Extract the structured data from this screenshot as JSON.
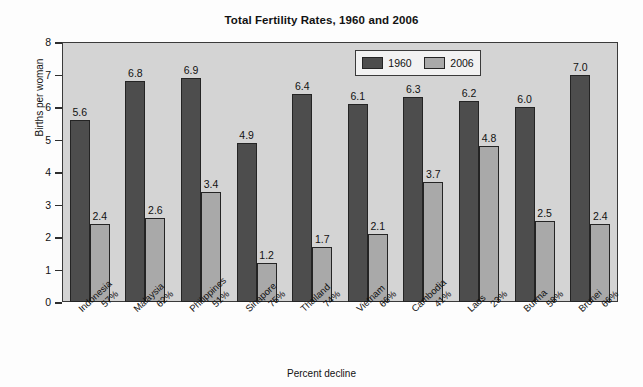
{
  "chart_data": {
    "type": "bar",
    "title": "Total Fertility Rates, 1960 and 2006",
    "xlabel": "Percent decline",
    "ylabel": "Births per woman",
    "ylim": [
      0,
      8
    ],
    "yticks": [
      0,
      1,
      2,
      3,
      4,
      5,
      6,
      7,
      8
    ],
    "ytick_labels": [
      "0",
      "1",
      "2",
      "3",
      "4",
      "5",
      "6",
      "7",
      "8"
    ],
    "grid": false,
    "legend_position": "upper center",
    "categories": [
      "Indonesia",
      "Malaysia",
      "Philippines",
      "Sinapore",
      "Thailand",
      "Vietnam",
      "Cambodia",
      "Laos",
      "Burma",
      "Brunei"
    ],
    "category_sublabels": [
      "57%",
      "62%",
      "51%",
      "75%",
      "74%",
      "66%",
      "41%",
      "23%",
      "58%",
      "66%"
    ],
    "series": [
      {
        "name": "1960",
        "color": "#4d4d4d",
        "values": [
          5.6,
          6.8,
          6.9,
          4.9,
          6.4,
          6.1,
          6.3,
          6.2,
          6.0,
          7.0
        ],
        "value_labels": [
          "5.6",
          "6.8",
          "6.9",
          "4.9",
          "6.4",
          "6.1",
          "6.3",
          "6.2",
          "6.0",
          "7.0"
        ]
      },
      {
        "name": "2006",
        "color": "#a9a9a9",
        "values": [
          2.4,
          2.6,
          3.4,
          1.2,
          1.7,
          2.1,
          3.7,
          4.8,
          2.5,
          2.4
        ],
        "value_labels": [
          "2.4",
          "2.6",
          "3.4",
          "1.2",
          "1.7",
          "2.1",
          "3.7",
          "4.8",
          "2.5",
          "2.4"
        ]
      }
    ],
    "plot_background": "#d4d4d4",
    "figure_background": "#fdfdfd",
    "axis_color": "#3a3a3a"
  }
}
